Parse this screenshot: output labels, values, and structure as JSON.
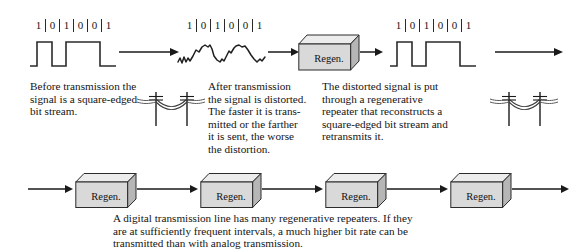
{
  "figure": {
    "bit_stream": [
      "1",
      "0",
      "1",
      "0",
      "0",
      "1"
    ],
    "regen_label": "Regen.",
    "colors": {
      "ink": "#141414",
      "box_face": "#d8d8d8",
      "box_top": "#ececec",
      "box_side": "#b8b8b8",
      "box_outline": "#2b2b2b",
      "background": "#ffffff"
    }
  },
  "top_row": {
    "stage1": {
      "bits_label": "1 0 1 0 0 1",
      "signal_type": "square-wave"
    },
    "stage2": {
      "bits_label": "1 0 1 0 0 1",
      "signal_type": "distorted-wave"
    },
    "stage3": {
      "device_label": "Regen."
    },
    "stage4": {
      "bits_label": "1 0 1 0 0 1",
      "signal_type": "square-wave"
    }
  },
  "captions": {
    "before": {
      "lines": [
        "Before transmission the",
        "signal is a square-edged",
        "bit stream."
      ]
    },
    "after": {
      "lines": [
        "After transmission",
        "the signal is distorted.",
        "The faster it is trans-",
        "mitted or the farther",
        "it is sent, the worse",
        "the distortion."
      ]
    },
    "regenerated": {
      "lines": [
        "The distorted signal is put",
        "through a regenerative",
        "repeater that reconstructs a",
        "square-edged bit stream and",
        "retransmits it."
      ]
    },
    "bottom": {
      "lines": [
        "A digital transmission line has many regenerative repeaters. If they",
        "are at sufficiently frequent intervals, a much higher bit rate can be",
        "transmitted than with analog transmission."
      ]
    }
  },
  "bottom_row": {
    "repeaters": [
      {
        "label": "Regen."
      },
      {
        "label": "Regen."
      },
      {
        "label": "Regen."
      },
      {
        "label": "Regen."
      }
    ]
  }
}
